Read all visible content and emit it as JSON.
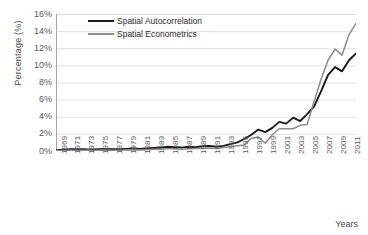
{
  "axes": {
    "ylabel": "Percentage (%)",
    "xlabel": "Years",
    "yticks": [
      "16%",
      "14%",
      "12%",
      "10%",
      "8%",
      "6%",
      "4%",
      "2%",
      "0%"
    ],
    "xticks": [
      "1969",
      "1971",
      "1973",
      "1975",
      "1977",
      "1979",
      "1981",
      "1983",
      "1985",
      "1987",
      "1989",
      "1991",
      "1993",
      "1995",
      "1997",
      "1999",
      "2001",
      "2003",
      "2005",
      "2007",
      "2009",
      "2011"
    ]
  },
  "legend": {
    "items": [
      {
        "label": "Spatial Autocorrelation",
        "color": "#1a1a1a"
      },
      {
        "label": "Spatial Econometrics",
        "color": "#8c8c8c"
      }
    ]
  },
  "chart_data": {
    "type": "line",
    "title": "",
    "xlabel": "Years",
    "ylabel": "Percentage (%)",
    "xlim": [
      1969,
      2012
    ],
    "ylim": [
      0,
      16
    ],
    "ytick_step": 2,
    "grid": true,
    "legend_position": "inside-top-left",
    "x": [
      1969,
      1970,
      1971,
      1972,
      1973,
      1974,
      1975,
      1976,
      1977,
      1978,
      1979,
      1980,
      1981,
      1982,
      1983,
      1984,
      1985,
      1986,
      1987,
      1988,
      1989,
      1990,
      1991,
      1992,
      1993,
      1994,
      1995,
      1996,
      1997,
      1998,
      1999,
      2000,
      2001,
      2002,
      2003,
      2004,
      2005,
      2006,
      2007,
      2008,
      2009,
      2010,
      2011,
      2012
    ],
    "series": [
      {
        "name": "Spatial Autocorrelation",
        "color": "#1a1a1a",
        "values": [
          0.1,
          0.15,
          0.2,
          0.2,
          0.2,
          0.15,
          0.2,
          0.25,
          0.2,
          0.2,
          0.25,
          0.3,
          0.25,
          0.3,
          0.35,
          0.4,
          0.5,
          0.45,
          0.4,
          0.5,
          0.45,
          0.55,
          0.6,
          0.5,
          0.6,
          0.8,
          1.0,
          1.4,
          1.9,
          2.5,
          2.2,
          2.7,
          3.4,
          3.2,
          3.9,
          3.5,
          4.3,
          5.2,
          7.0,
          8.9,
          9.8,
          9.3,
          10.6,
          11.4
        ]
      },
      {
        "name": "Spatial Econometrics",
        "color": "#8c8c8c",
        "values": [
          0.05,
          0.05,
          0.08,
          0.08,
          0.1,
          0.08,
          0.1,
          0.12,
          0.1,
          0.1,
          0.12,
          0.15,
          0.12,
          0.15,
          0.2,
          0.2,
          0.25,
          0.25,
          0.2,
          0.25,
          0.3,
          0.3,
          0.35,
          0.3,
          0.4,
          0.5,
          0.6,
          0.7,
          1.5,
          1.6,
          0.9,
          1.9,
          2.6,
          2.6,
          2.6,
          3.0,
          3.1,
          5.8,
          8.4,
          10.6,
          11.9,
          11.2,
          13.6,
          14.9
        ]
      }
    ]
  }
}
